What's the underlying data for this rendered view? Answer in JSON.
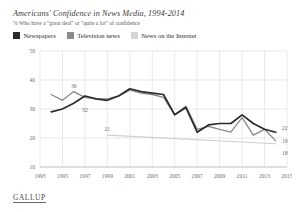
{
  "header": {
    "title": "Americans' Confidence in News Media, 1994-2014",
    "subtitle": "% Who have a \"great deal\" or \"quite a lot\" of confidence"
  },
  "legend": {
    "items": [
      {
        "label": "Newspapers",
        "color": "#2b2b2b"
      },
      {
        "label": "Television news",
        "color": "#8a8a8a"
      },
      {
        "label": "News on the Internet",
        "color": "#cfcfcf"
      }
    ]
  },
  "footer": {
    "brand": "GALLUP"
  },
  "annotations": [
    {
      "name": "tv-peak-1996",
      "text": "36"
    },
    {
      "name": "newspapers-1997",
      "text": "32"
    },
    {
      "name": "internet-start-1999",
      "text": "21"
    },
    {
      "name": "newspapers-end-2014",
      "text": "22"
    },
    {
      "name": "television-end-2014",
      "text": "19"
    },
    {
      "name": "internet-end-2014",
      "text": "18"
    }
  ],
  "chart_data": {
    "type": "line",
    "title": "Americans' Confidence in News Media, 1994-2014",
    "subtitle": "% Who have a \"great deal\" or \"quite a lot\" of confidence",
    "xlabel": "",
    "ylabel": "",
    "xlim": [
      1993,
      2015
    ],
    "ylim": [
      10,
      50
    ],
    "yticks": [
      10,
      20,
      30,
      40,
      50
    ],
    "xticks": [
      1993,
      1995,
      1997,
      1999,
      2001,
      2003,
      2005,
      2007,
      2009,
      2011,
      2013,
      2015
    ],
    "grid": true,
    "legend_position": "top-left",
    "series": [
      {
        "name": "Newspapers",
        "color": "#2b2b2b",
        "x": [
          1994,
          1995,
          1996,
          1997,
          1998,
          1999,
          2000,
          2001,
          2002,
          2003,
          2004,
          2005,
          2006,
          2007,
          2008,
          2009,
          2010,
          2011,
          2012,
          2013,
          2014
        ],
        "values": [
          29,
          30,
          32,
          34.5,
          33.5,
          33,
          34.5,
          37,
          36,
          35.5,
          35,
          28,
          30.5,
          22,
          24.5,
          25,
          25,
          28,
          25,
          23,
          22
        ]
      },
      {
        "name": "Television news",
        "color": "#8a8a8a",
        "x": [
          1994,
          1995,
          1996,
          1997,
          1998,
          1999,
          2000,
          2001,
          2002,
          2003,
          2004,
          2005,
          2006,
          2007,
          2008,
          2009,
          2010,
          2011,
          2012,
          2013,
          2014
        ],
        "values": [
          35,
          33,
          36,
          34,
          33.5,
          33.5,
          34.5,
          36.5,
          35.5,
          35,
          34,
          28,
          31,
          23,
          24,
          23,
          22,
          27,
          21,
          23,
          19
        ]
      },
      {
        "name": "News on the Internet",
        "color": "#cfcfcf",
        "x": [
          1999,
          2014
        ],
        "values": [
          21,
          18
        ]
      }
    ]
  }
}
